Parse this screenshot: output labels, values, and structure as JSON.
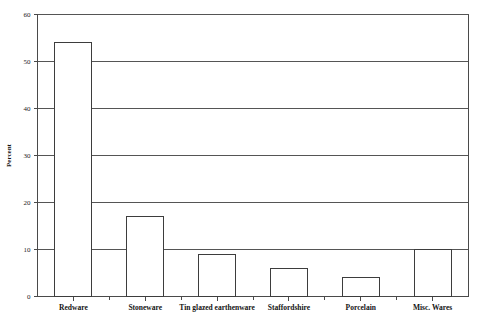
{
  "chart_data": {
    "type": "bar",
    "title": "",
    "subtitle": "",
    "xlabel": "",
    "ylabel": "Percent",
    "ylim": [
      0,
      60
    ],
    "yticks": [
      0,
      10,
      20,
      30,
      40,
      50,
      60
    ],
    "ytick_labels": [
      "0",
      "10",
      "20",
      "30",
      "40",
      "50",
      "60"
    ],
    "grid": true,
    "grid_axis": "y",
    "legend": false,
    "legend_position": "none",
    "categories": [
      "Redware",
      "Stoneware",
      "Tin glazed earthenware",
      "Staffordshire",
      "Porcelain",
      "Misc. Wares"
    ],
    "values": [
      54,
      17,
      9,
      6,
      4,
      10
    ],
    "bar_fill_color": "#ffffff",
    "bar_edge_color": "#3d3d3d",
    "axis_color": "#4a4a4a",
    "grid_color": "#555555",
    "background_color": "#ffffff"
  },
  "axes": {
    "y_axis_title": "Percent"
  }
}
